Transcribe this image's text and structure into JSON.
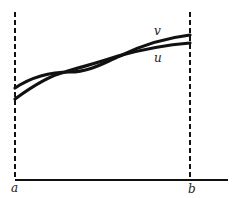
{
  "diagram": {
    "labels": {
      "a": "a",
      "b": "b",
      "u": "u",
      "v": "v"
    },
    "colors": {
      "stroke": "#111111",
      "background": "#ffffff"
    }
  }
}
